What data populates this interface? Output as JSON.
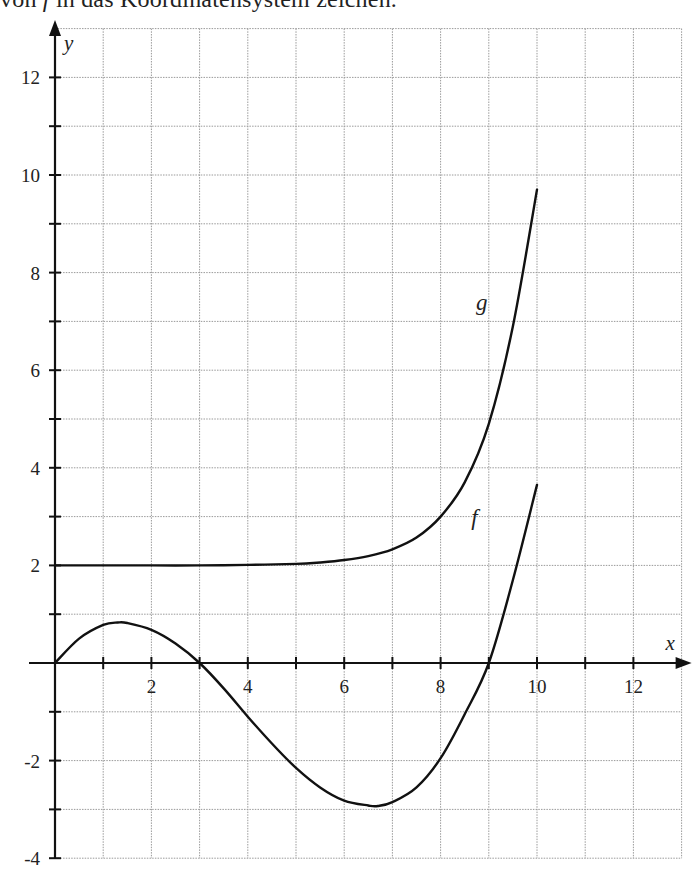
{
  "caption": {
    "text_before": "von ",
    "italic": "f",
    "text_after": " in das Koordinatensystem zeichen."
  },
  "chart_data": {
    "type": "line",
    "title": "",
    "xlabel": "x",
    "ylabel": "y",
    "xlim": [
      0,
      13
    ],
    "ylim": [
      -4,
      13
    ],
    "grid": true,
    "grid_step": 1,
    "x_tick_labels": [
      "2",
      "4",
      "6",
      "8",
      "10",
      "12"
    ],
    "x_tick_values": [
      2,
      4,
      6,
      8,
      10,
      12
    ],
    "y_tick_labels": [
      "12",
      "10",
      "8",
      "6",
      "4",
      "2",
      "-2",
      "-4"
    ],
    "y_tick_values": [
      12,
      10,
      8,
      6,
      4,
      2,
      -2,
      -4
    ],
    "legend": "none (curves labeled inline)",
    "series": [
      {
        "name": "f",
        "label_position": {
          "x": 8.8,
          "y": 3.0
        },
        "x": [
          0,
          0.5,
          1,
          1.3,
          1.5,
          2,
          2.5,
          3,
          3.5,
          4,
          4.5,
          5,
          5.5,
          6,
          6.5,
          6.7,
          7,
          7.5,
          8,
          8.5,
          9,
          9.5,
          10
        ],
        "y": [
          0,
          0.5,
          0.78,
          0.83,
          0.82,
          0.68,
          0.4,
          0,
          -0.52,
          -1.1,
          -1.65,
          -2.15,
          -2.55,
          -2.82,
          -2.92,
          -2.93,
          -2.85,
          -2.55,
          -1.95,
          -1.05,
          0,
          1.7,
          3.65
        ]
      },
      {
        "name": "g",
        "label_position": {
          "x": 8.9,
          "y": 7.4
        },
        "x": [
          0,
          1,
          2,
          3,
          4,
          5,
          5.5,
          6,
          6.5,
          7,
          7.5,
          8,
          8.5,
          9,
          9.5,
          10
        ],
        "y": [
          2.0,
          2.0,
          2.0,
          2.0,
          2.01,
          2.03,
          2.06,
          2.11,
          2.19,
          2.33,
          2.57,
          3.0,
          3.7,
          4.9,
          6.9,
          9.7
        ]
      }
    ],
    "annotations": {
      "f_zeros": [
        0,
        3,
        9
      ],
      "f_local_max": {
        "x": 1.3,
        "y": 0.83
      },
      "f_local_min": {
        "x": 6.7,
        "y": -2.93
      },
      "g_asymptote": 2
    }
  }
}
